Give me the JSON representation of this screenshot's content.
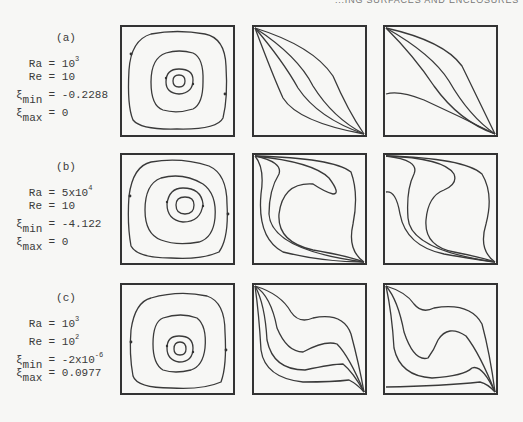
{
  "header": {
    "text": "...ING SURFACES AND ENCLOSURES"
  },
  "cases": [
    {
      "label": "(a)",
      "Ra": {
        "name": "Ra",
        "base": "10",
        "exp": "3"
      },
      "Re": {
        "name": "Re",
        "value": "10"
      },
      "xi_min": {
        "name": "ξ",
        "sub": "min",
        "value": "-0.2288"
      },
      "xi_max": {
        "name": "ξ",
        "sub": "max",
        "value": "0"
      }
    },
    {
      "label": "(b)",
      "Ra": {
        "name": "Ra",
        "base": "5x10",
        "exp": "4"
      },
      "Re": {
        "name": "Re",
        "value": "10"
      },
      "xi_min": {
        "name": "ξ",
        "sub": "min",
        "value": "-4.122"
      },
      "xi_max": {
        "name": "ξ",
        "sub": "max",
        "value": "0"
      }
    },
    {
      "label": "(c)",
      "Ra": {
        "name": "Ra",
        "base": "10",
        "exp": "3"
      },
      "Re": {
        "name": "Re",
        "base": "10",
        "exp": "2"
      },
      "xi_min": {
        "name": "ξ",
        "sub": "min",
        "base": "-2x10",
        "exp": "-6"
      },
      "xi_max": {
        "name": "ξ",
        "sub": "max",
        "value": "0.0977"
      }
    }
  ],
  "figure": {
    "columns": [
      "streamlines",
      "isotherms",
      "concentration-lines"
    ],
    "line_color": "#3a3a3a",
    "frame_color": "#333333",
    "background": "#f7f7f5"
  }
}
